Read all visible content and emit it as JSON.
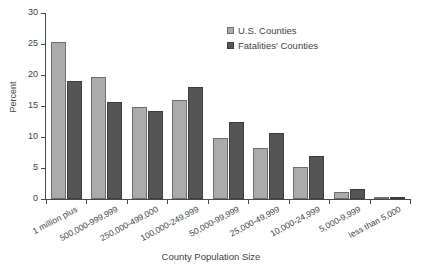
{
  "chart_data": {
    "type": "bar",
    "title": "",
    "xlabel": "County Population Size",
    "ylabel": "Percent",
    "ylim": [
      0,
      30
    ],
    "yticks": [
      0,
      5,
      10,
      15,
      20,
      25,
      30
    ],
    "grid": false,
    "legend_position": "top-right",
    "categories": [
      "1 million plus",
      "500,000-999,999",
      "250,000-499,000",
      "100,000-249,999",
      "50,000-99,999",
      "25,000-49,999",
      "10,000-24,999",
      "5,000-9,999",
      "less than 5,000"
    ],
    "series": [
      {
        "name": "U.S. Counties",
        "color": "#ababab",
        "values": [
          25.4,
          19.6,
          14.8,
          16.0,
          9.9,
          8.2,
          5.2,
          1.1,
          0.2
        ]
      },
      {
        "name": "Fatalities' Counties",
        "color": "#555555",
        "values": [
          19.1,
          15.6,
          14.2,
          18.1,
          12.4,
          10.6,
          6.9,
          1.6,
          0.3
        ]
      }
    ]
  },
  "axes": {
    "y_title": "Percent",
    "x_title": "County Population Size",
    "y_tick_labels": [
      "0",
      "5",
      "10",
      "15",
      "20",
      "25",
      "30"
    ]
  },
  "legend": {
    "items": [
      {
        "label": "U.S. Counties",
        "swatch": "light-gray-square-icon"
      },
      {
        "label": "Fatalities' Counties",
        "swatch": "dark-gray-square-icon"
      }
    ]
  }
}
